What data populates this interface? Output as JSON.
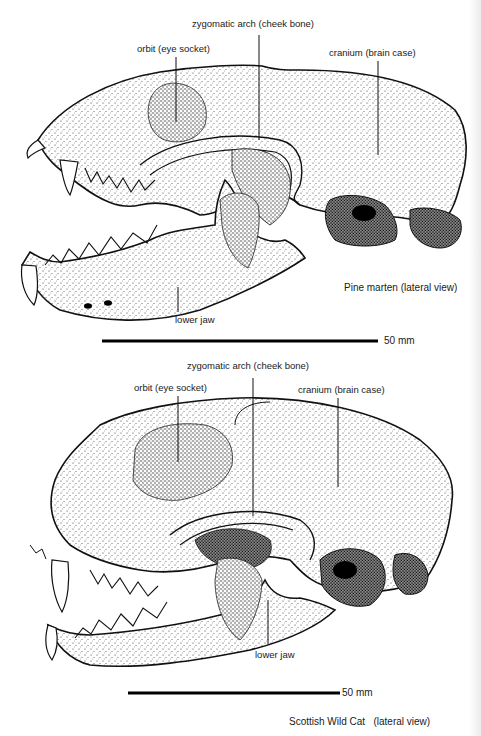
{
  "figures": [
    {
      "name": "pine-marten",
      "caption": "Pine marten (lateral view)",
      "labels": {
        "zygomatic": "zygomatic arch (cheek bone)",
        "orbit": "orbit (eye socket)",
        "cranium": "cranium (brain case)",
        "lower_jaw": "lower jaw"
      },
      "scale_bar": "50 mm"
    },
    {
      "name": "scottish-wild-cat",
      "caption": "Scottish Wild Cat   (lateral view)",
      "labels": {
        "zygomatic": "zygomatic arch (cheek bone)",
        "orbit": "orbit (eye socket)",
        "cranium": "cranium (brain case)",
        "lower_jaw": "lower jaw"
      },
      "scale_bar": "50 mm"
    }
  ],
  "colors": {
    "ink": "#1a1a1a",
    "paper": "#ffffff",
    "stipple": "#555555"
  }
}
